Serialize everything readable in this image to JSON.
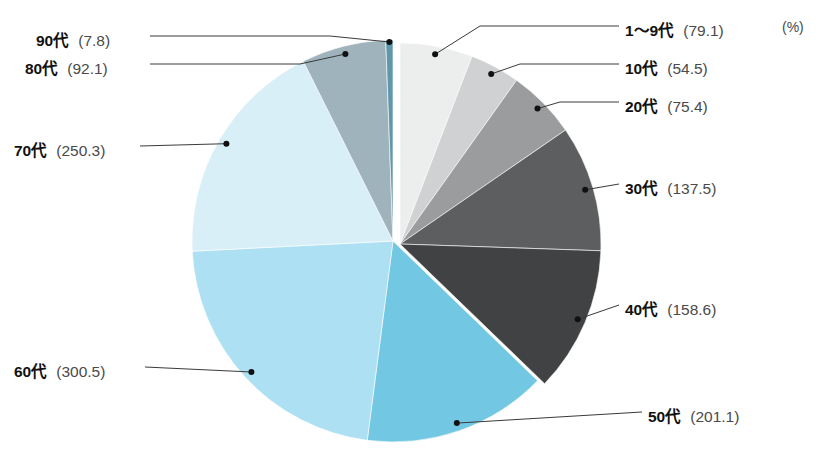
{
  "chart_data": {
    "type": "pie",
    "title": "",
    "unit_label": "(%)",
    "total": 1277.4,
    "legend_position": "callout-labels",
    "grid": false,
    "categories": [
      "1〜9代",
      "10代",
      "20代",
      "30代",
      "40代",
      "50代",
      "60代",
      "70代",
      "80代",
      "90代"
    ],
    "values": [
      79.1,
      54.5,
      75.4,
      137.5,
      158.6,
      201.1,
      300.5,
      250.3,
      92.1,
      7.8
    ],
    "colors": [
      "#eceded",
      "#cfd1d2",
      "#9a9c9d",
      "#5c5e5f",
      "#414243",
      "#72c7e3",
      "#ade0f2",
      "#d8eff8",
      "#9fb3bd",
      "#5f97ab"
    ],
    "slices": [
      {
        "label": "1〜9代",
        "value": 79.1,
        "value_text": "(79.1)",
        "color": "#eceded",
        "group": "gray"
      },
      {
        "label": "10代",
        "value": 54.5,
        "value_text": "(54.5)",
        "color": "#cfd1d2",
        "group": "gray"
      },
      {
        "label": "20代",
        "value": 75.4,
        "value_text": "(75.4)",
        "color": "#9a9c9d",
        "group": "gray"
      },
      {
        "label": "30代",
        "value": 137.5,
        "value_text": "(137.5)",
        "color": "#5c5e5f",
        "group": "gray"
      },
      {
        "label": "40代",
        "value": 158.6,
        "value_text": "(158.6)",
        "color": "#414243",
        "group": "gray"
      },
      {
        "label": "50代",
        "value": 201.1,
        "value_text": "(201.1)",
        "color": "#72c7e3",
        "group": "blue"
      },
      {
        "label": "60代",
        "value": 300.5,
        "value_text": "(300.5)",
        "color": "#ade0f2",
        "group": "blue"
      },
      {
        "label": "70代",
        "value": 250.3,
        "value_text": "(250.3)",
        "color": "#d8eff8",
        "group": "blue"
      },
      {
        "label": "80代",
        "value": 92.1,
        "value_text": "(92.1)",
        "color": "#9fb3bd",
        "group": "blue"
      },
      {
        "label": "90代",
        "value": 7.8,
        "value_text": "(7.8)",
        "color": "#5f97ab",
        "group": "blue"
      }
    ]
  },
  "labels": {
    "unit": "(%)",
    "right": [
      {
        "name": "1〜9代",
        "value": "(79.1)"
      },
      {
        "name": "10代",
        "value": "(54.5)"
      },
      {
        "name": "20代",
        "value": "(75.4)"
      },
      {
        "name": "30代",
        "value": "(137.5)"
      },
      {
        "name": "40代",
        "value": "(158.6)"
      },
      {
        "name": "50代",
        "value": "(201.1)"
      }
    ],
    "left": [
      {
        "name": "90代",
        "value": "(7.8)"
      },
      {
        "name": "80代",
        "value": "(92.1)"
      },
      {
        "name": "70代",
        "value": "(250.3)"
      },
      {
        "name": "60代",
        "value": "(300.5)"
      }
    ]
  }
}
